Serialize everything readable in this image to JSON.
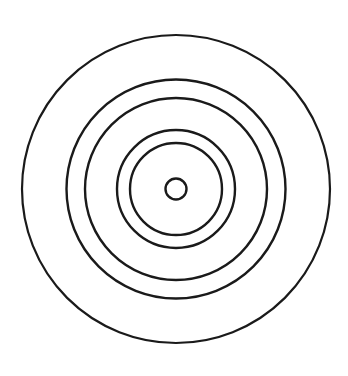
{
  "figure": {
    "width": 348,
    "height": 376,
    "background": "#ffffff",
    "stroke_color": "#1a1a1a",
    "center": {
      "x": 176,
      "y": 189
    },
    "circles": [
      {
        "r": 154,
        "stroke_width": 2.2
      },
      {
        "r": 109.5,
        "stroke_width": 2.4
      },
      {
        "r": 91,
        "stroke_width": 2.4
      },
      {
        "r": 59,
        "stroke_width": 2.4
      },
      {
        "r": 46,
        "stroke_width": 2.4
      },
      {
        "r": 10.5,
        "stroke_width": 2.4
      }
    ]
  }
}
